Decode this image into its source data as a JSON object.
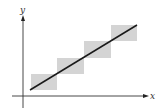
{
  "diagram": {
    "x_axis_label": "x",
    "y_axis_label": "y",
    "colors": {
      "axis": "#222222",
      "line": "#1a1a1a",
      "box_fill": "#d4d4d4"
    },
    "boxes": [
      {
        "x": 31,
        "y": 74,
        "w": 26,
        "h": 16
      },
      {
        "x": 57,
        "y": 58,
        "w": 27,
        "h": 16
      },
      {
        "x": 84,
        "y": 41,
        "w": 27,
        "h": 17
      },
      {
        "x": 111,
        "y": 25,
        "w": 26,
        "h": 16
      }
    ],
    "line": {
      "x1": 30,
      "y1": 90,
      "x2": 137,
      "y2": 25
    }
  }
}
